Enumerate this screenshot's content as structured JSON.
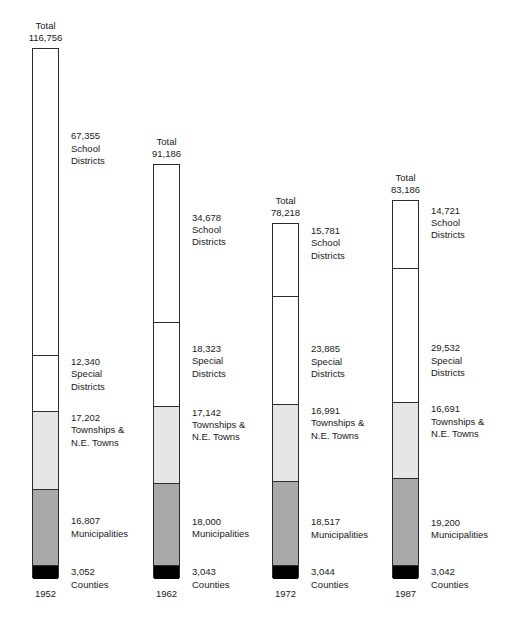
{
  "chart_data": {
    "type": "bar",
    "title": "",
    "subtitle": "",
    "xlabel": "",
    "ylabel": "",
    "stacked": true,
    "grid": false,
    "legend_position": "none",
    "axis_range": [
      0,
      116756
    ],
    "categories": [
      "1952",
      "1962",
      "1972",
      "1987"
    ],
    "totals": [
      "116,756",
      "91,186",
      "78,218",
      "83,186"
    ],
    "total_values": [
      116756,
      91186,
      78218,
      83186
    ],
    "total_label": "Total",
    "series": [
      {
        "name": "School Districts",
        "name_lines": [
          "School",
          "Districts"
        ],
        "fill": "#ffffff",
        "values": [
          67355,
          34678,
          15781,
          14721
        ],
        "labels": [
          "67,355",
          "34,678",
          "15,781",
          "14,721"
        ]
      },
      {
        "name": "Special Districts",
        "name_lines": [
          "Special",
          "Districts"
        ],
        "fill": "#ffffff",
        "values": [
          12340,
          18323,
          23885,
          29532
        ],
        "labels": [
          "12,340",
          "18,323",
          "23,885",
          "29,532"
        ]
      },
      {
        "name": "Townships & N.E. Towns",
        "name_lines": [
          "Townships &",
          "N.E. Towns"
        ],
        "fill": "#e6e6e6",
        "values": [
          17202,
          17142,
          16991,
          16691
        ],
        "labels": [
          "17,202",
          "17,142",
          "16,991",
          "16,691"
        ]
      },
      {
        "name": "Municipalities",
        "name_lines": [
          "Municipalities"
        ],
        "fill": "#a9a9a9",
        "values": [
          16807,
          18000,
          18517,
          19200
        ],
        "labels": [
          "16,807",
          "18,000",
          "18,517",
          "19,200"
        ]
      },
      {
        "name": "Counties",
        "name_lines": [
          "Counties"
        ],
        "fill": "#000000",
        "values": [
          3052,
          3043,
          3044,
          3042
        ],
        "labels": [
          "3,052",
          "3,043",
          "3,044",
          "3,042"
        ]
      }
    ]
  },
  "bars": [
    {
      "year": "1952",
      "total": "116,756",
      "total_word": "Total",
      "segments": [
        {
          "value": "67,355",
          "l1": "School",
          "l2": "Districts"
        },
        {
          "value": "12,340",
          "l1": "Special",
          "l2": "Districts"
        },
        {
          "value": "17,202",
          "l1": "Townships &",
          "l2": "N.E. Towns"
        },
        {
          "value": "16,807",
          "l1": "Municipalities",
          "l2": ""
        },
        {
          "value": "3,052",
          "l1": "Counties",
          "l2": ""
        }
      ]
    },
    {
      "year": "1962",
      "total": "91,186",
      "total_word": "Total",
      "segments": [
        {
          "value": "34,678",
          "l1": "School",
          "l2": "Districts"
        },
        {
          "value": "18,323",
          "l1": "Special",
          "l2": "Districts"
        },
        {
          "value": "17,142",
          "l1": "Townships &",
          "l2": "N.E. Towns"
        },
        {
          "value": "18,000",
          "l1": "Municipalities",
          "l2": ""
        },
        {
          "value": "3,043",
          "l1": "Counties",
          "l2": ""
        }
      ]
    },
    {
      "year": "1972",
      "total": "78,218",
      "total_word": "Total",
      "segments": [
        {
          "value": "15,781",
          "l1": "School",
          "l2": "Districts"
        },
        {
          "value": "23,885",
          "l1": "Special",
          "l2": "Districts"
        },
        {
          "value": "16,991",
          "l1": "Townships &",
          "l2": "N.E. Towns"
        },
        {
          "value": "18,517",
          "l1": "Municipalities",
          "l2": ""
        },
        {
          "value": "3,044",
          "l1": "Counties",
          "l2": ""
        }
      ]
    },
    {
      "year": "1987",
      "total": "83,186",
      "total_word": "Total",
      "segments": [
        {
          "value": "14,721",
          "l1": "School",
          "l2": "Districts"
        },
        {
          "value": "29,532",
          "l1": "Special",
          "l2": "Districts"
        },
        {
          "value": "16,691",
          "l1": "Townships &",
          "l2": "N.E. Towns"
        },
        {
          "value": "19,200",
          "l1": "Municipalities",
          "l2": ""
        },
        {
          "value": "3,042",
          "l1": "Counties",
          "l2": ""
        }
      ]
    }
  ]
}
